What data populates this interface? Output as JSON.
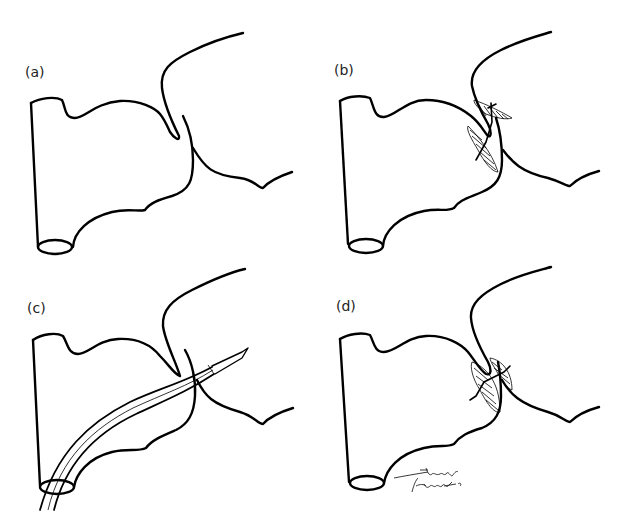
{
  "figure": {
    "panels": [
      {
        "id": "a",
        "label": "(a)",
        "description": "Anatomy with septal defect, no device"
      },
      {
        "id": "b",
        "label": "(b)",
        "description": "Occluder device deployed across defect"
      },
      {
        "id": "c",
        "label": "(c)",
        "description": "Catheter with needle tip passed through defect"
      },
      {
        "id": "d",
        "label": "(d)",
        "description": "Occluder device seated across defect"
      }
    ],
    "signature": {
      "line1": "Tinsley",
      "line2": "Herbert '01"
    },
    "colors": {
      "line": "#000000",
      "background": "#ffffff",
      "label": "#222222"
    }
  }
}
